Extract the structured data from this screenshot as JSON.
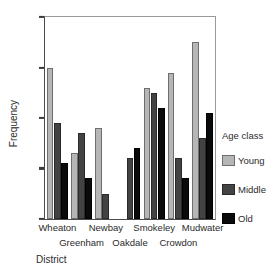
{
  "chart_data": {
    "type": "bar",
    "title": "",
    "xlabel": "District",
    "ylabel": "Frequency",
    "ylim": [
      0,
      40
    ],
    "yticks": [
      0,
      10,
      20,
      30,
      40
    ],
    "grid": false,
    "legend_position": "right",
    "legend_title": "Age class",
    "categories": [
      "Wheaton",
      "Greenham",
      "Newbay",
      "Oakdale",
      "Smokeley",
      "Crowdon",
      "Mudwater"
    ],
    "category_rows": [
      0,
      1,
      0,
      1,
      0,
      1,
      0
    ],
    "series": [
      {
        "name": "Young",
        "color": "#b6b6b6",
        "values": [
          30,
          13,
          18,
          0,
          26,
          29,
          35
        ]
      },
      {
        "name": "Middle",
        "color": "#434343",
        "values": [
          19,
          17,
          5,
          12,
          25,
          12,
          16
        ]
      },
      {
        "name": "Old",
        "color": "#0a0a0a",
        "values": [
          11,
          8,
          0,
          14,
          22,
          8,
          21
        ]
      }
    ]
  }
}
